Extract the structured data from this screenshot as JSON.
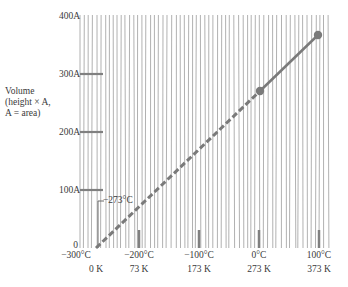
{
  "chart_data": {
    "type": "line",
    "title": "",
    "xlabel": "",
    "ylabel": "Volume (height × A, A = area)",
    "ylabel_lines": [
      "Volume",
      "(height × A,",
      "A = area)"
    ],
    "x_ticks_celsius": [
      "−300°C",
      "−200°C",
      "−100°C",
      "0°C",
      "100°C"
    ],
    "x_ticks_kelvin": [
      "",
      "0 K",
      "73 K",
      "173 K",
      "273 K",
      "373 K"
    ],
    "x_ticks": [
      {
        "c": "−300°C",
        "k": "0 K"
      },
      {
        "c": "−200°C",
        "k": "73 K"
      },
      {
        "c": "−100°C",
        "k": "173 K"
      },
      {
        "c": "0°C",
        "k": "273 K"
      },
      {
        "c": "100°C",
        "k": "373 K"
      }
    ],
    "y_ticks": [
      "0",
      "100A",
      "200A",
      "300A",
      "400A"
    ],
    "xlim": [
      -300,
      110
    ],
    "ylim": [
      0,
      400
    ],
    "grid": "vertical lines (dense)",
    "series": [
      {
        "name": "Measured (solid)",
        "style": "solid",
        "x": [
          0,
          100
        ],
        "y": [
          273,
          373
        ],
        "markers": true
      },
      {
        "name": "Extrapolated (dashed)",
        "style": "dashed",
        "x": [
          -273,
          0
        ],
        "y": [
          0,
          273
        ],
        "markers": false
      }
    ],
    "annotations": [
      {
        "text": "−273°C",
        "x": -273,
        "y": 0
      }
    ],
    "colors": {
      "line": "#7a7a7a",
      "grid": "#9a9a9a",
      "tick": "#8a8a8a",
      "text": "#3a3a3a"
    }
  },
  "labels": {
    "y0": "0",
    "y100": "100A",
    "y200": "200A",
    "y300": "300A",
    "y400": "400A",
    "ylabel1": "Volume",
    "ylabel2": "(height × A,",
    "ylabel3": "A = area)",
    "xc1": "−300°C",
    "xc2": "−200°C",
    "xc3": "−100°C",
    "xc4": "0°C",
    "xc5": "100°C",
    "xk1": "0 K",
    "xk2": "73 K",
    "xk3": "173 K",
    "xk4": "273 K",
    "xk5": "373 K",
    "annot": "−273°C"
  }
}
